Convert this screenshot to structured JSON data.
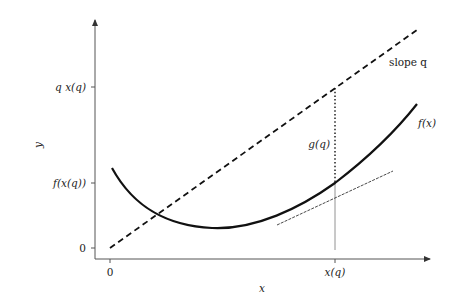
{
  "diagram": {
    "axes": {
      "x_label": "x",
      "y_label": "y",
      "x_ticks": [
        "0",
        "x(q)"
      ],
      "y_ticks": [
        "0",
        "f(x(q))",
        "q x(q)"
      ]
    },
    "annotations": {
      "slope_label": "slope q",
      "curve_label": "f(x)",
      "gap_label": "g(q)"
    },
    "colors": {
      "axis": "#555555",
      "curve": "#111111",
      "line": "#111111",
      "background": "#ffffff"
    }
  }
}
